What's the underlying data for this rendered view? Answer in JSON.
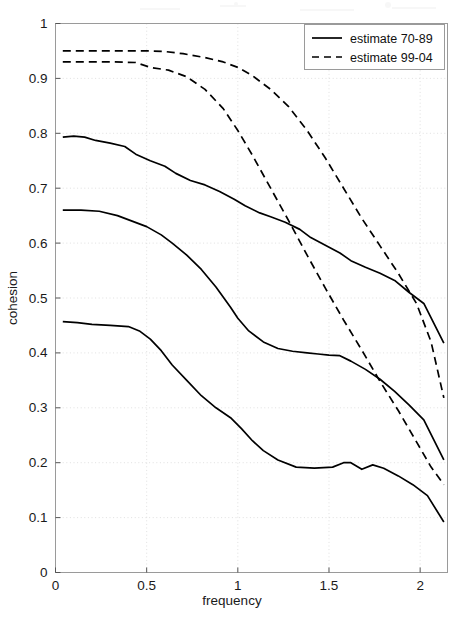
{
  "chart_data": {
    "type": "line",
    "title": "",
    "xlabel": "frequency",
    "ylabel": "cohesion",
    "xlim": [
      0,
      2.15
    ],
    "ylim": [
      0,
      1
    ],
    "grid": true,
    "legend_position": "top-right",
    "xticks": [
      0,
      0.5,
      1,
      1.5,
      2
    ],
    "xtick_labels": [
      "0",
      "0.5",
      "1",
      "1.5",
      "2"
    ],
    "yticks": [
      0,
      0.1,
      0.2,
      0.3,
      0.4,
      0.5,
      0.6,
      0.7,
      0.8,
      0.9,
      1
    ],
    "ytick_labels": [
      "0",
      "0.1",
      "0.2",
      "0.3",
      "0.4",
      "0.5",
      "0.6",
      "0.7",
      "0.8",
      "0.9",
      "1"
    ],
    "legend": [
      {
        "label": "estimate 70-89",
        "style": "solid"
      },
      {
        "label": "estimate 99-04",
        "style": "dashed"
      }
    ],
    "series": [
      {
        "name": "estimate 99-04 upper",
        "style": "dashed",
        "x": [
          0.04,
          0.2,
          0.36,
          0.52,
          0.6,
          0.7,
          0.82,
          0.92,
          1.0,
          1.08,
          1.18,
          1.28,
          1.38,
          1.48,
          1.58,
          1.68,
          1.78,
          1.88,
          1.98,
          2.06,
          2.13
        ],
        "y": [
          0.95,
          0.95,
          0.95,
          0.95,
          0.949,
          0.945,
          0.938,
          0.93,
          0.92,
          0.905,
          0.88,
          0.848,
          0.805,
          0.755,
          0.7,
          0.645,
          0.595,
          0.545,
          0.49,
          0.42,
          0.318
        ]
      },
      {
        "name": "estimate 99-04 lower",
        "style": "dashed",
        "x": [
          0.04,
          0.18,
          0.32,
          0.44,
          0.52,
          0.62,
          0.72,
          0.82,
          0.92,
          1.0,
          1.08,
          1.18,
          1.28,
          1.38,
          1.48,
          1.58,
          1.68,
          1.78,
          1.88,
          1.98,
          2.06,
          2.13
        ],
        "y": [
          0.93,
          0.93,
          0.93,
          0.929,
          0.92,
          0.915,
          0.903,
          0.88,
          0.845,
          0.805,
          0.76,
          0.7,
          0.64,
          0.578,
          0.518,
          0.46,
          0.405,
          0.348,
          0.295,
          0.238,
          0.192,
          0.16
        ]
      },
      {
        "name": "estimate 70-89 upper",
        "style": "solid",
        "x": [
          0.04,
          0.1,
          0.16,
          0.22,
          0.3,
          0.38,
          0.44,
          0.52,
          0.6,
          0.66,
          0.74,
          0.82,
          0.9,
          0.98,
          1.04,
          1.12,
          1.18,
          1.26,
          1.34,
          1.4,
          1.48,
          1.56,
          1.62,
          1.7,
          1.78,
          1.86,
          1.94,
          2.02,
          2.13
        ],
        "y": [
          0.793,
          0.795,
          0.793,
          0.787,
          0.782,
          0.776,
          0.762,
          0.75,
          0.74,
          0.727,
          0.714,
          0.706,
          0.694,
          0.68,
          0.668,
          0.655,
          0.648,
          0.638,
          0.625,
          0.61,
          0.596,
          0.582,
          0.568,
          0.556,
          0.545,
          0.532,
          0.51,
          0.49,
          0.418
        ]
      },
      {
        "name": "estimate 70-89 mid",
        "style": "solid",
        "x": [
          0.04,
          0.14,
          0.24,
          0.34,
          0.42,
          0.5,
          0.58,
          0.64,
          0.72,
          0.8,
          0.88,
          0.96,
          1.0,
          1.06,
          1.14,
          1.22,
          1.3,
          1.38,
          1.44,
          1.5,
          1.56,
          1.62,
          1.7,
          1.78,
          1.86,
          1.94,
          2.02,
          2.13
        ],
        "y": [
          0.66,
          0.66,
          0.658,
          0.65,
          0.64,
          0.63,
          0.615,
          0.6,
          0.578,
          0.552,
          0.52,
          0.483,
          0.463,
          0.44,
          0.42,
          0.408,
          0.403,
          0.4,
          0.398,
          0.396,
          0.395,
          0.385,
          0.37,
          0.352,
          0.33,
          0.305,
          0.278,
          0.205
        ]
      },
      {
        "name": "estimate 70-89 lower",
        "style": "solid",
        "x": [
          0.04,
          0.12,
          0.2,
          0.3,
          0.4,
          0.46,
          0.52,
          0.58,
          0.64,
          0.72,
          0.8,
          0.88,
          0.96,
          1.02,
          1.08,
          1.14,
          1.22,
          1.32,
          1.42,
          1.52,
          1.58,
          1.62,
          1.68,
          1.74,
          1.8,
          1.88,
          1.96,
          2.04,
          2.13
        ],
        "y": [
          0.457,
          0.455,
          0.452,
          0.45,
          0.448,
          0.44,
          0.425,
          0.404,
          0.378,
          0.35,
          0.322,
          0.3,
          0.282,
          0.262,
          0.24,
          0.222,
          0.205,
          0.192,
          0.19,
          0.192,
          0.2,
          0.2,
          0.188,
          0.196,
          0.19,
          0.176,
          0.16,
          0.14,
          0.092
        ]
      }
    ]
  },
  "axes": {
    "x_label": "frequency",
    "y_label": "cohesion"
  }
}
